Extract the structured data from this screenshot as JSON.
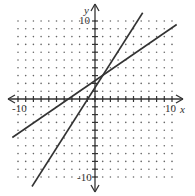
{
  "chart_data": {
    "type": "line",
    "title": "",
    "xlabel": "x",
    "ylabel": "y",
    "xlim": [
      -10,
      10
    ],
    "ylim": [
      -10,
      10
    ],
    "grid": "dotted",
    "tick_labels": {
      "x_min": "-10",
      "x_max": "10",
      "y_min": "-10",
      "y_max": "10"
    },
    "series": [
      {
        "name": "steeper line",
        "equation": "y ≈ 1.5x + 2",
        "slope": 1.5,
        "intercept": 2,
        "x": [
          -8.2,
          6.2
        ],
        "y": [
          -10.3,
          11.3
        ]
      },
      {
        "name": "shallower line",
        "equation": "y ≈ (2/3)x + 2.3",
        "slope": 0.6667,
        "intercept": 2.3,
        "x": [
          -10.7,
          10.6
        ],
        "y": [
          -4.8,
          9.4
        ]
      }
    ],
    "intersection_approx": [
      0.4,
      2.7
    ]
  },
  "labels": {
    "x_axis": "x",
    "y_axis": "y",
    "x_neg": "-10",
    "x_pos": "10",
    "y_pos": "10",
    "y_neg": "-10"
  },
  "colors": {
    "line": "#333333",
    "axis": "#333333",
    "grid": "#555555"
  }
}
